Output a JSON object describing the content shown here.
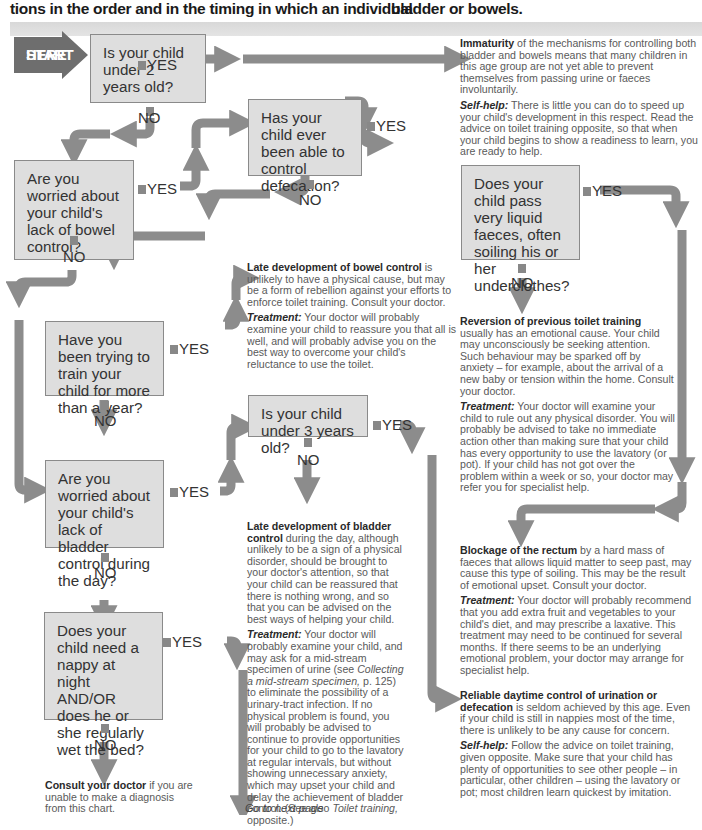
{
  "header": {
    "left_fragment": "tions in the order and in the timing in which an individual",
    "right_fragment": "bladder or bowels."
  },
  "start_badge": {
    "line1": "START",
    "line2": "HERE"
  },
  "labels": {
    "yes": "YES",
    "no": "NO"
  },
  "questions": {
    "q1": "Is your child under 2 years old?",
    "q2": "Are you worried about your child's lack of bowel control?",
    "q3": "Has your child ever been able to control defecation?",
    "q4": "Does your child pass very liquid faeces, often soiling his or her underclothes?",
    "q5": "Have you been trying to train your child for more than a year?",
    "q6": "Is your child under 3 years old?",
    "q7": "Are you worried about your child's lack of bladder control during the day?",
    "q8": "Does your child need a nappy at night AND/OR does he or she regularly wet the bed?"
  },
  "outcomes": {
    "immaturity": {
      "title": "Immaturity",
      "body": " of the mechanisms for controlling both bladder and bowels means that many children in this age group are not yet able to prevent themselves from passing urine or faeces involuntarily.",
      "advice_label": "Self-help:",
      "advice": " There is little you can do to speed up your child's development in this respect. Read the advice on toilet training opposite, so that when your child begins to show a readiness to learn, you are ready to help."
    },
    "late_bowel": {
      "title": "Late development of bowel control",
      "body": " is unlikely to have a physical cause, but may be a form of rebellion against your efforts to enforce toilet training. Consult your doctor.",
      "advice_label": "Treatment:",
      "advice": " Your doctor will probably examine your child to reassure you that all is well, and will probably advise you on the best way to overcome your child's reluctance to use the toilet."
    },
    "reversion": {
      "title": "Reversion of previous toilet training",
      "body": " usually has an emotional cause. Your child may unconsciously be seeking attention. Such behaviour may be sparked off by anxiety – for example, about the arrival of a new baby or tension within the home. Consult your doctor.",
      "advice_label": "Treatment:",
      "advice": " Your doctor will examine your child to rule out any physical disorder. You will probably be advised to take no immediate action other than making sure that your child has every opportunity to use the lavatory (or pot). If your child has not got over the problem within a week or so, your doctor may refer you for specialist help."
    },
    "late_bladder": {
      "title": "Late development of bladder control",
      "body": " during the day, although unlikely to be a sign of a physical disorder, should be brought to your doctor's attention, so that your child can be reassured that there is nothing wrong, and so that you can be advised on the best ways of helping your child.",
      "advice_label": "Treatment:",
      "advice_a": " Your doctor will probably examine your child, and may ask for a mid-stream specimen of urine (see ",
      "advice_link": "Collecting a mid-stream specimen,",
      "advice_b": " p. 125) to eliminate the possibility of a urinary-tract infection. If no physical problem is found, you will probably be advised to continue to provide opportunities for your child to go to the lavatory at regular intervals, but without showing unnecessary anxiety, which may upset your child and delay the achievement of bladder control. (See also ",
      "advice_link2": "Toilet training,",
      "advice_c": " opposite.)"
    },
    "blockage": {
      "title": "Blockage of the rectum",
      "body": " by a hard mass of faeces that allows liquid matter to seep past, may cause this type of soiling. This may be the result of emotional upset. Consult your doctor.",
      "advice_label": "Treatment:",
      "advice": " Your doctor will probably recommend that you add extra fruit and vegetables to your child's diet, and may prescribe a laxative. This treatment may need to be continued for several months. If there seems to be an underlying emotional problem, your doctor may arrange for specialist help."
    },
    "reliable": {
      "title": "Reliable daytime control of urination or defecation",
      "body": " is seldom achieved by this age. Even if your child is still in nappies most of the time, there is unlikely to be any cause for concern.",
      "advice_label": "Self-help:",
      "advice": " Follow the advice on toilet training, given opposite. Make sure that your child has plenty of opportunities to see other people – in particular, other children – using the lavatory or pot; most children learn quickest by imitation."
    },
    "consult": {
      "title": "Consult your doctor",
      "body": " if you are unable to make a diagnosis from this chart."
    }
  },
  "footer": {
    "next_page": "Go to next page"
  },
  "colors": {
    "box_fill": "#dedede",
    "box_border": "#8a8a8a",
    "arrow": "#8c8c8c",
    "start_badge": "#6e6e6e",
    "band": "#dcdcdc"
  }
}
